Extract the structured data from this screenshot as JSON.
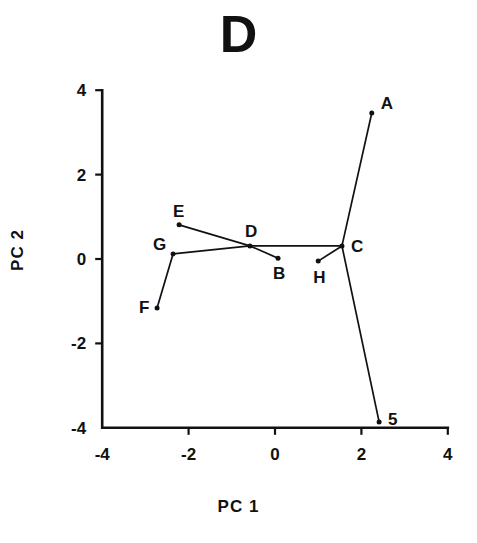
{
  "figure": {
    "panel_title": "D",
    "xlabel": "PC  1",
    "ylabel": "PC  2"
  },
  "chart_data": {
    "type": "scatter",
    "title": "D",
    "xlabel": "PC 1",
    "ylabel": "PC 2",
    "xlim": [
      -4,
      4
    ],
    "ylim": [
      -4,
      4
    ],
    "xticks": [
      -4,
      -2,
      0,
      2,
      4
    ],
    "yticks": [
      -4,
      -2,
      0,
      2,
      4
    ],
    "xtick_labels": [
      "-4",
      "-2",
      "0",
      "2",
      "4"
    ],
    "ytick_labels": [
      "-4",
      "-2",
      "0",
      "2",
      "4"
    ],
    "grid": false,
    "legend": "none",
    "point_labels": [
      "A",
      "B",
      "C",
      "D",
      "E",
      "F",
      "G",
      "H",
      "5"
    ],
    "points": [
      {
        "label": "A",
        "x": 2.24,
        "y": 3.46,
        "label_dx": 9,
        "label_dy": -4
      },
      {
        "label": "B",
        "x": 0.07,
        "y": 0.02,
        "label_dx": -5,
        "label_dy": 21
      },
      {
        "label": "C",
        "x": 1.55,
        "y": 0.31,
        "label_dx": 9,
        "label_dy": 6
      },
      {
        "label": "D",
        "x": -0.58,
        "y": 0.31,
        "label_dx": -5,
        "label_dy": -9
      },
      {
        "label": "E",
        "x": -2.22,
        "y": 0.81,
        "label_dx": -6,
        "label_dy": -8
      },
      {
        "label": "F",
        "x": -2.73,
        "y": -1.16,
        "label_dx": -18,
        "label_dy": 5
      },
      {
        "label": "G",
        "x": -2.36,
        "y": 0.12,
        "label_dx": -20,
        "label_dy": -4
      },
      {
        "label": "H",
        "x": 1.0,
        "y": -0.05,
        "label_dx": -5,
        "label_dy": 22
      },
      {
        "label": "5",
        "x": 2.41,
        "y": -3.86,
        "label_dx": 9,
        "label_dy": 3
      }
    ],
    "edges": [
      [
        "A",
        "C"
      ],
      [
        "C",
        "5"
      ],
      [
        "C",
        "H"
      ],
      [
        "C",
        "D"
      ],
      [
        "D",
        "B"
      ],
      [
        "D",
        "E"
      ],
      [
        "D",
        "G"
      ],
      [
        "G",
        "F"
      ]
    ]
  },
  "colors": {
    "ink": "#111111",
    "background": "#ffffff"
  }
}
